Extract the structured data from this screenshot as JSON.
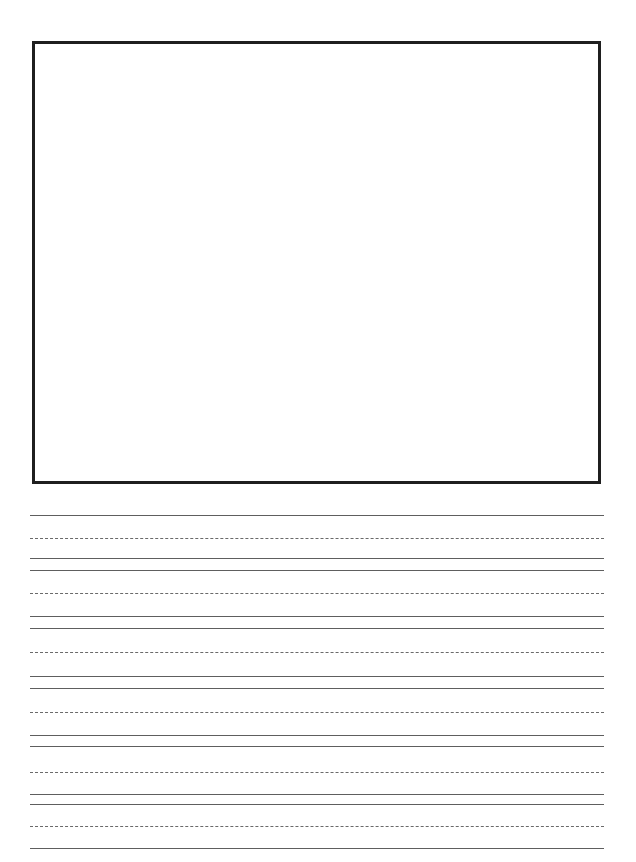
{
  "page": {
    "width": 636,
    "height": 862,
    "background_color": "#ffffff"
  },
  "drawing_box": {
    "name": "illustration-area",
    "label": "",
    "border_color": "#1f1f1f",
    "border_width_px": 3,
    "fill_color": "#ffffff",
    "x": 32,
    "y": 41,
    "width": 569,
    "height": 443
  },
  "ruling": {
    "left_margin_px": 30,
    "right_edge_px": 604,
    "line_length_px": 574,
    "solid_color": "#5e5e5e",
    "dashed_color": "#6a6a6a",
    "group_period_px": 60,
    "group_count": 6,
    "lines_per_group": 4,
    "first_line_y": 515,
    "pattern": [
      "solid",
      "dashed",
      "solid",
      "solid"
    ],
    "lines": [
      {
        "y": 515,
        "style": "solid"
      },
      {
        "y": 538,
        "style": "dashed"
      },
      {
        "y": 558,
        "style": "solid"
      },
      {
        "y": 570,
        "style": "solid"
      },
      {
        "y": 593,
        "style": "dashed"
      },
      {
        "y": 616,
        "style": "solid"
      },
      {
        "y": 628,
        "style": "solid"
      },
      {
        "y": 652,
        "style": "dashed"
      },
      {
        "y": 676,
        "style": "solid"
      },
      {
        "y": 688,
        "style": "solid"
      },
      {
        "y": 712,
        "style": "dashed"
      },
      {
        "y": 735,
        "style": "solid"
      },
      {
        "y": 746,
        "style": "solid"
      },
      {
        "y": 772,
        "style": "dashed"
      },
      {
        "y": 794,
        "style": "solid"
      },
      {
        "y": 804,
        "style": "solid"
      },
      {
        "y": 826,
        "style": "dashed"
      },
      {
        "y": 848,
        "style": "solid"
      }
    ]
  }
}
